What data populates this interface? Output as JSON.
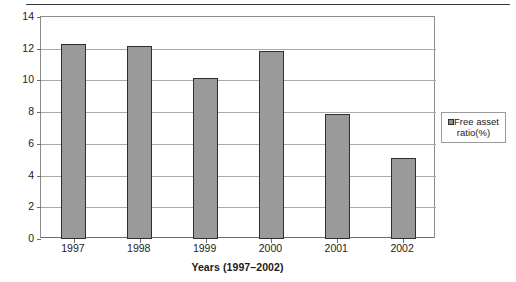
{
  "chart_data": {
    "type": "bar",
    "title": "",
    "subtitle": "",
    "xlabel": "Years (1997–2002)",
    "ylabel": "",
    "categories": [
      "1997",
      "1998",
      "1999",
      "2000",
      "2001",
      "2002"
    ],
    "series": [
      {
        "name": "Free asset ratio(%)",
        "values": [
          12.3,
          12.15,
          10.15,
          11.85,
          7.9,
          5.1
        ]
      }
    ],
    "values": [
      12.3,
      12.15,
      10.15,
      11.85,
      7.9,
      5.1
    ],
    "ylim": [
      0,
      14
    ],
    "ytick_labels": [
      "0",
      "2",
      "4",
      "6",
      "8",
      "10",
      "12",
      "14"
    ],
    "ytick_values": [
      0,
      2,
      4,
      6,
      8,
      10,
      12,
      14
    ],
    "grid": "horizontal",
    "legend_position": "right",
    "legend_entries": [
      "Free asset ratio(%)"
    ],
    "bar_color": "#9a9a9a",
    "bar_border_color": "#2f2f2f",
    "gridline_color": "#a9a9a9",
    "axis_color": "#6e6e6e",
    "plot_background": "#ffffff"
  },
  "legend": {
    "marker_icon": "square-marker-icon",
    "label": "Free asset ratio(%)"
  }
}
